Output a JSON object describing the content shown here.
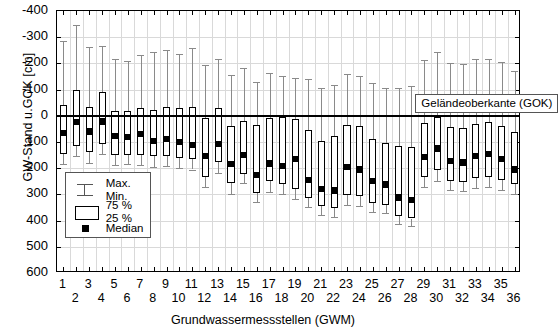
{
  "chart_data": {
    "type": "boxplot",
    "title": "",
    "xlabel": "Grundwassermessstellen (GWM)",
    "ylabel": "GW-Stand u.GOK [cm]",
    "ylim": [
      -400,
      600
    ],
    "y_inverted": true,
    "yticks": [
      -400,
      -300,
      -200,
      -100,
      0,
      100,
      200,
      300,
      400,
      500,
      600
    ],
    "ytick_labels": [
      "-400",
      "-300",
      "-200",
      "-100",
      "0",
      "100",
      "200",
      "300",
      "400",
      "500",
      "600"
    ],
    "grid": true,
    "reference_line": {
      "value": 0,
      "label": "Geländeoberkante (GOK)"
    },
    "categories": [
      1,
      2,
      3,
      4,
      5,
      6,
      7,
      8,
      9,
      10,
      11,
      12,
      13,
      14,
      15,
      16,
      17,
      18,
      19,
      20,
      21,
      22,
      23,
      24,
      25,
      26,
      27,
      28,
      29,
      30,
      31,
      32,
      33,
      34,
      35,
      36
    ],
    "xtick_labels": [
      "1",
      "2",
      "3",
      "4",
      "5",
      "6",
      "7",
      "8",
      "9",
      "10",
      "11",
      "12",
      "13",
      "14",
      "15",
      "16",
      "17",
      "18",
      "19",
      "20",
      "21",
      "22",
      "23",
      "24",
      "25",
      "26",
      "27",
      "28",
      "29",
      "30",
      "31",
      "32",
      "33",
      "34",
      "35",
      "36"
    ],
    "boxes": [
      {
        "x": 1,
        "min": -285,
        "q25": -40,
        "median": 67,
        "q75": 145,
        "max": 185
      },
      {
        "x": 2,
        "min": -345,
        "q25": -100,
        "median": 25,
        "q75": 115,
        "max": 152
      },
      {
        "x": 3,
        "min": -262,
        "q25": -32,
        "median": 60,
        "q75": 140,
        "max": 180
      },
      {
        "x": 4,
        "min": -268,
        "q25": -92,
        "median": 22,
        "q75": 108,
        "max": 145
      },
      {
        "x": 5,
        "min": -215,
        "q25": -18,
        "median": 78,
        "q75": 150,
        "max": 188
      },
      {
        "x": 6,
        "min": -208,
        "q25": -20,
        "median": 82,
        "q75": 148,
        "max": 185
      },
      {
        "x": 7,
        "min": -232,
        "q25": -28,
        "median": 68,
        "q75": 148,
        "max": 188
      },
      {
        "x": 8,
        "min": -245,
        "q25": -22,
        "median": 95,
        "q75": 155,
        "max": 195
      },
      {
        "x": 9,
        "min": -252,
        "q25": -32,
        "median": 88,
        "q75": 152,
        "max": 192
      },
      {
        "x": 10,
        "min": -235,
        "q25": -28,
        "median": 100,
        "q75": 160,
        "max": 200
      },
      {
        "x": 11,
        "min": -258,
        "q25": -35,
        "median": 110,
        "q75": 165,
        "max": 205
      },
      {
        "x": 12,
        "min": -192,
        "q25": 10,
        "median": 155,
        "q75": 232,
        "max": 272
      },
      {
        "x": 13,
        "min": -218,
        "q25": -30,
        "median": 108,
        "q75": 178,
        "max": 218
      },
      {
        "x": 14,
        "min": -155,
        "q25": 40,
        "median": 185,
        "q75": 258,
        "max": 298
      },
      {
        "x": 15,
        "min": -182,
        "q25": 20,
        "median": 150,
        "q75": 222,
        "max": 255
      },
      {
        "x": 16,
        "min": -130,
        "q25": 35,
        "median": 225,
        "q75": 295,
        "max": 330
      },
      {
        "x": 17,
        "min": -165,
        "q25": 8,
        "median": 182,
        "q75": 248,
        "max": 292
      },
      {
        "x": 18,
        "min": -152,
        "q25": 5,
        "median": 192,
        "q75": 262,
        "max": 298
      },
      {
        "x": 19,
        "min": -145,
        "q25": 12,
        "median": 165,
        "q75": 278,
        "max": 318
      },
      {
        "x": 20,
        "min": -140,
        "q25": 55,
        "median": 245,
        "q75": 312,
        "max": 348
      },
      {
        "x": 21,
        "min": -108,
        "q25": 95,
        "median": 278,
        "q75": 345,
        "max": 378
      },
      {
        "x": 22,
        "min": -118,
        "q25": 78,
        "median": 285,
        "q75": 352,
        "max": 385
      },
      {
        "x": 23,
        "min": -160,
        "q25": 35,
        "median": 195,
        "q75": 302,
        "max": 340
      },
      {
        "x": 24,
        "min": -152,
        "q25": 40,
        "median": 205,
        "q75": 308,
        "max": 345
      },
      {
        "x": 25,
        "min": -125,
        "q25": 88,
        "median": 248,
        "q75": 332,
        "max": 368
      },
      {
        "x": 26,
        "min": -108,
        "q25": 102,
        "median": 262,
        "q75": 340,
        "max": 372
      },
      {
        "x": 27,
        "min": -105,
        "q25": 115,
        "median": 312,
        "q75": 382,
        "max": 412
      },
      {
        "x": 28,
        "min": -112,
        "q25": 118,
        "median": 322,
        "q75": 392,
        "max": 422
      },
      {
        "x": 29,
        "min": -212,
        "q25": 28,
        "median": 158,
        "q75": 232,
        "max": 272
      },
      {
        "x": 30,
        "min": -242,
        "q25": 5,
        "median": 125,
        "q75": 208,
        "max": 248
      },
      {
        "x": 31,
        "min": -200,
        "q25": 42,
        "median": 172,
        "q75": 248,
        "max": 285
      },
      {
        "x": 32,
        "min": -198,
        "q25": 45,
        "median": 178,
        "q75": 252,
        "max": 288
      },
      {
        "x": 33,
        "min": -215,
        "q25": 30,
        "median": 152,
        "q75": 238,
        "max": 275
      },
      {
        "x": 34,
        "min": -218,
        "q25": 25,
        "median": 145,
        "q75": 235,
        "max": 272
      },
      {
        "x": 35,
        "min": -205,
        "q25": 40,
        "median": 165,
        "q75": 245,
        "max": 282
      },
      {
        "x": 36,
        "min": -172,
        "q25": 62,
        "median": 205,
        "q75": 262,
        "max": 300
      }
    ],
    "groups": [
      {
        "label": "Flutrinnen",
        "from": 1,
        "to": 12
      },
      {
        "label": "elbfern",
        "from": 13,
        "to": 20
      },
      {
        "label": "trockenes Grünland",
        "from": 21,
        "to": 28
      },
      {
        "label": "elbnah",
        "from": 21,
        "to": 28
      },
      {
        "label": "feuchtes Grünland",
        "from": 29,
        "to": 36
      }
    ],
    "group_brackets": [
      {
        "from": 1,
        "to": 12
      },
      {
        "from": 13,
        "to": 20
      },
      {
        "from": 21,
        "to": 28
      },
      {
        "from": 29,
        "to": 36
      }
    ],
    "group_labels": [
      {
        "text": "Flutrinnen",
        "center": 6.5
      },
      {
        "text": "elbfern",
        "center": 14.0
      },
      {
        "text": "trockenes Grünland",
        "center": 20.0
      },
      {
        "text": "elbnah",
        "center": 25.5
      },
      {
        "text": "feuchtes Grünland",
        "center": 32.5
      }
    ]
  },
  "legend": {
    "title": "",
    "entries": [
      {
        "icon": "whisker-icon",
        "line1": "Max.",
        "line2": "Min."
      },
      {
        "icon": "box-icon",
        "line1": "75 %",
        "line2": "25 %"
      },
      {
        "icon": "median-icon",
        "line1": "Median",
        "line2": ""
      }
    ]
  },
  "colors": {
    "axis": "#000000",
    "grid": "#d9d9d9",
    "whisker": "#8a8a8a",
    "box_edge": "#000000",
    "median": "#000000",
    "reference_line": "#000000",
    "bracket": "#777777"
  }
}
